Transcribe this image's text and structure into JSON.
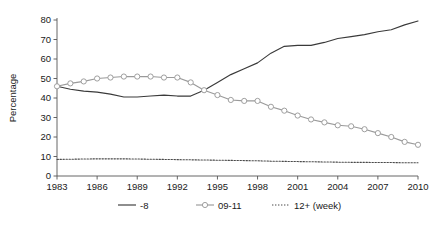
{
  "chart_data": {
    "type": "line",
    "title": "",
    "xlabel": "",
    "ylabel": "Percentage",
    "xlim": [
      1983,
      2010
    ],
    "ylim": [
      0,
      80
    ],
    "yticks": [
      0,
      10,
      20,
      30,
      40,
      50,
      60,
      70,
      80
    ],
    "xticks": [
      1983,
      1986,
      1989,
      1992,
      1995,
      1998,
      2001,
      2004,
      2007,
      2010
    ],
    "grid": false,
    "legend_position": "bottom",
    "x": [
      1983,
      1984,
      1985,
      1986,
      1987,
      1988,
      1989,
      1990,
      1991,
      1992,
      1993,
      1994,
      1995,
      1996,
      1997,
      1998,
      1999,
      2000,
      2001,
      2002,
      2003,
      2004,
      2005,
      2006,
      2007,
      2008,
      2009,
      2010
    ],
    "series": [
      {
        "name": "-8",
        "style": "solid",
        "marker": "none",
        "color": "#3a3a3a",
        "values": [
          46.0,
          44.5,
          43.5,
          43.0,
          42.0,
          40.5,
          40.5,
          41.0,
          41.5,
          41.0,
          41.0,
          44.0,
          48.0,
          52.0,
          55.0,
          58.0,
          63.0,
          66.5,
          67.0,
          67.0,
          68.5,
          70.5,
          71.5,
          72.5,
          74.0,
          75.0,
          77.5,
          79.5
        ]
      },
      {
        "name": "09-11",
        "style": "solid",
        "marker": "circle",
        "color": "#9a9a9a",
        "values": [
          46.0,
          47.5,
          48.5,
          50.0,
          50.5,
          51.0,
          51.0,
          51.0,
          50.5,
          50.5,
          48.0,
          44.0,
          41.5,
          39.0,
          38.5,
          38.5,
          35.5,
          33.5,
          31.0,
          29.0,
          27.5,
          26.0,
          25.5,
          24.0,
          22.0,
          20.0,
          17.5,
          16.0
        ]
      },
      {
        "name": "12+ (week)",
        "style": "dotted",
        "marker": "none",
        "color": "#4a4a4a",
        "values": [
          8.5,
          8.6,
          8.7,
          8.8,
          8.8,
          8.8,
          8.7,
          8.6,
          8.5,
          8.4,
          8.3,
          8.2,
          8.1,
          8.0,
          7.9,
          7.8,
          7.6,
          7.5,
          7.4,
          7.3,
          7.2,
          7.1,
          7.0,
          7.0,
          6.9,
          6.9,
          6.8,
          6.8
        ]
      }
    ],
    "legend": [
      {
        "label": "-8",
        "style": "solid",
        "marker": "none",
        "color": "#3a3a3a"
      },
      {
        "label": "09-11",
        "style": "solid",
        "marker": "circle",
        "color": "#9a9a9a"
      },
      {
        "label": "12+ (week)",
        "style": "dotted",
        "marker": "none",
        "color": "#4a4a4a"
      }
    ]
  },
  "axes": {
    "ylabel": "Percentage",
    "ytick_labels": [
      "0",
      "10",
      "20",
      "30",
      "40",
      "50",
      "60",
      "70",
      "80"
    ],
    "xtick_labels": [
      "1983",
      "1986",
      "1989",
      "1992",
      "1995",
      "1998",
      "2001",
      "2004",
      "2007",
      "2010"
    ]
  },
  "legend": {
    "item0": "-8",
    "item1": "09-11",
    "item2": "12+ (week)"
  },
  "colors": {
    "line_dark": "#3a3a3a",
    "line_gray": "#9a9a9a",
    "line_dotted": "#4a4a4a",
    "axis": "#555555",
    "text": "#1a1a1a",
    "background": "#ffffff"
  }
}
